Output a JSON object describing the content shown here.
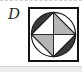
{
  "option": {
    "label": "D"
  },
  "figure": {
    "colors": {
      "dark": "#3a3a3a",
      "gray": "#b5b5b5",
      "line": "#1c1c1c",
      "frame": "#141414",
      "background": "#ffffff"
    },
    "regions": {
      "top_left_segment": "dark",
      "top_right_segment": "white",
      "bottom_left_segment": "white",
      "bottom_right_segment": "dark",
      "top_left_triangle": "white",
      "top_right_triangle": "gray",
      "bottom_left_triangle": "gray",
      "bottom_right_triangle": "white"
    }
  }
}
